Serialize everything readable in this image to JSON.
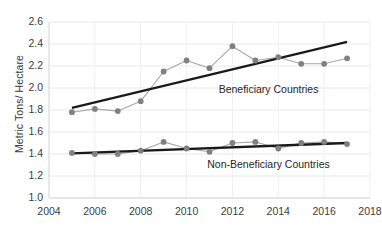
{
  "chart_data": {
    "type": "line",
    "title": "",
    "xlabel": "",
    "ylabel": "Metric Tons/ Hectare",
    "xlim": [
      2004,
      2018
    ],
    "ylim": [
      1.0,
      2.6
    ],
    "grid": true,
    "legend_position": "inline-annotation",
    "x_ticks": [
      "2004",
      "2006",
      "2008",
      "2010",
      "2012",
      "2014",
      "2016",
      "2018"
    ],
    "y_ticks": [
      "1.0",
      "1.2",
      "1.4",
      "1.6",
      "1.8",
      "2.0",
      "2.2",
      "2.4",
      "2.6"
    ],
    "x": [
      2005,
      2006,
      2007,
      2008,
      2009,
      2010,
      2011,
      2012,
      2013,
      2014,
      2015,
      2016,
      2017
    ],
    "series": [
      {
        "name": "Beneficiary Countries",
        "values": [
          1.78,
          1.81,
          1.79,
          1.88,
          2.15,
          2.25,
          2.18,
          2.38,
          2.25,
          2.28,
          2.22,
          2.22,
          2.27
        ],
        "marker_color": "#808080",
        "line_color": "#a6a6a6",
        "trendline": {
          "x0": 2005,
          "y0": 1.82,
          "x1": 2017,
          "y1": 2.42,
          "color": "#1a1a1a"
        }
      },
      {
        "name": "Non-Beneficiary Countries",
        "values": [
          1.41,
          1.4,
          1.4,
          1.43,
          1.51,
          1.45,
          1.42,
          1.5,
          1.51,
          1.45,
          1.5,
          1.51,
          1.49
        ],
        "marker_color": "#808080",
        "line_color": "#a6a6a6",
        "trendline": {
          "x0": 2005,
          "y0": 1.405,
          "x1": 2017,
          "y1": 1.5,
          "color": "#1a1a1a"
        }
      }
    ],
    "annotations": [
      {
        "text": "Beneficiary Countries",
        "x": 2011.4,
        "y": 1.98
      },
      {
        "text": "Non-Beneficiary Countries",
        "x": 2010.9,
        "y": 1.3
      }
    ]
  }
}
